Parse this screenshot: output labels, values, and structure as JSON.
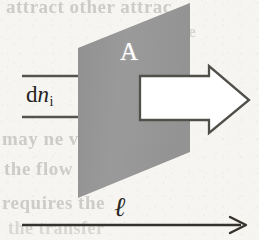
{
  "figure": {
    "background_color": "#f6f5f2"
  },
  "surface": {
    "name": "cross-sectional-area-plane",
    "label": "A",
    "label_color": "#ffffff",
    "fill_color": "#989898",
    "shape": "parallelogram",
    "corners": "78,48 190,3 190,152 78,198"
  },
  "flux": {
    "label_d": "d",
    "label_n": "n",
    "label_subscript": "i",
    "label_full": "dn_i",
    "color": "#26241f",
    "shaft_line_top_y": 76,
    "shaft_line_bottom_y": 117,
    "shaft_line_left_x": 22
  },
  "flow_arrow": {
    "name": "block-arrow-right",
    "direction": "right",
    "fill_color": "#ffffff",
    "stroke_color": "#4a4843",
    "tip_x": 249,
    "tip_y": 100
  },
  "length_axis": {
    "label": "ℓ",
    "color": "#2a2824",
    "direction": "right",
    "start_x": 22,
    "end_x": 243,
    "y": 225
  },
  "ghost_text": {
    "line_1": "attract other attrac",
    "line_2": "om be",
    "line_3": "may ne vita",
    "line_4": "the flow of en",
    "line_5": "requires the",
    "line_6": "the transfer"
  }
}
